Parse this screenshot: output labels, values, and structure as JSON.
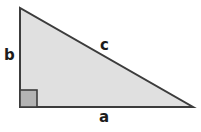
{
  "diagram": {
    "name": "right-triangle",
    "type": "geometry-figure",
    "background_color": "#ffffff",
    "triangle": {
      "fill_color": "#e0e0e0",
      "stroke_color": "#3c3c3c",
      "stroke_width": 2,
      "vertices": {
        "top_left": {
          "x": 20,
          "y": 8
        },
        "bottom_left": {
          "x": 20,
          "y": 107
        },
        "bottom_right": {
          "x": 193,
          "y": 107
        }
      }
    },
    "right_angle_marker": {
      "name": "right-angle-square",
      "fill_color": "#b3b3b3",
      "stroke_color": "#3c3c3c",
      "x": 20,
      "y": 90,
      "width": 17,
      "height": 17
    },
    "labels": {
      "vertical_leg": "b",
      "hypotenuse": "c",
      "horizontal_leg": "a"
    },
    "label_color": "#1c1c1c"
  }
}
